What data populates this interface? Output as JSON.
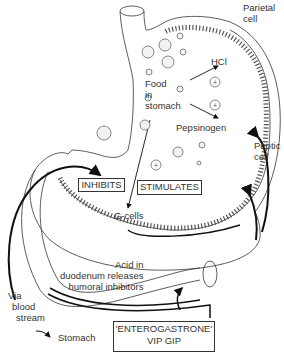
{
  "diagram": {
    "labels": {
      "parietal_cell": [
        "Parietal",
        "cell"
      ],
      "hcl": "HCl",
      "food": [
        "Food",
        "in",
        "stomach"
      ],
      "pepsinogen": "Pepsinogen",
      "peptic_cell": [
        "Peptic",
        "cell"
      ],
      "inhibits": "INHIBITS",
      "stimulates": "STIMULATES",
      "g_cells": "G-cells",
      "acid": [
        "Acid in",
        "duodenum releases",
        "humoral inhibitors"
      ],
      "via_blood": [
        "Via",
        "blood",
        "stream"
      ],
      "stomach": "Stomach",
      "enterogastrone": [
        "'ENTEROGASTRONE'",
        "VIP  GIP"
      ]
    }
  }
}
